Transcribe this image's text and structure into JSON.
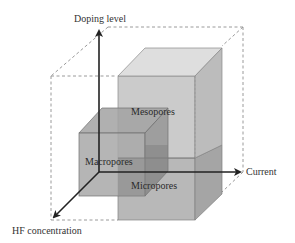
{
  "diagram": {
    "type": "3d-axis-cube-diagram",
    "axes": {
      "vertical": {
        "label": "Doping level"
      },
      "horizontal": {
        "label": "Current"
      },
      "depth": {
        "label": "HF concentration"
      }
    },
    "regions": [
      {
        "id": "mesopores",
        "label": "Mesopores"
      },
      {
        "id": "macropores",
        "label": "Macropores"
      },
      {
        "id": "micropores",
        "label": "Micropores"
      }
    ],
    "colors": {
      "axis": "#222222",
      "dashed_box": "#999999",
      "cube_light_front": "#c8c8c8",
      "cube_light_top": "#dcdcdc",
      "cube_light_side": "#b8b8b8",
      "cube_dark_front": "#a9a9a9",
      "cube_dark_top": "#b5b5b5",
      "cube_dark_side": "#9a9a9a",
      "overlap": "#8c8c8c",
      "edge": "#7a7a7a"
    }
  }
}
